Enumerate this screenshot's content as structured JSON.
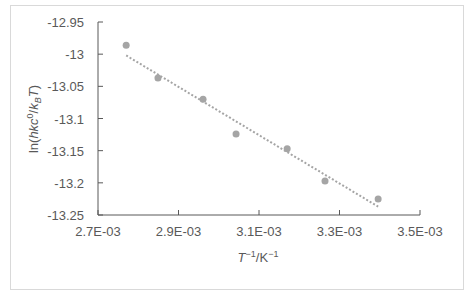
{
  "chart_data": {
    "type": "scatter",
    "title": "",
    "xlabel": "T^-1/K^-1",
    "ylabel": "ln(hkc^0/k_B T)",
    "xlim": [
      0.0027,
      0.0035
    ],
    "ylim": [
      -13.25,
      -12.95
    ],
    "x_ticks": [
      "2.7E-03",
      "2.9E-03",
      "3.1E-03",
      "3.3E-03",
      "3.5E-03"
    ],
    "y_ticks": [
      "-12.95",
      "-13",
      "-13.05",
      "-13.1",
      "-13.15",
      "-13.2",
      "-13.25"
    ],
    "grid": false,
    "legend": null,
    "series": [
      {
        "name": "data",
        "marker_color": "#a5a5a5",
        "x": [
          0.00277,
          0.002849,
          0.002961,
          0.003043,
          0.00317,
          0.003264,
          0.003396
        ],
        "y": [
          -12.986,
          -13.037,
          -13.07,
          -13.124,
          -13.147,
          -13.197,
          -13.225
        ]
      }
    ],
    "trendline": {
      "type": "linear",
      "style": "dotted",
      "color": "#a5a5a5",
      "x": [
        0.00277,
        0.003396
      ],
      "y": [
        -13.002,
        -13.237
      ]
    }
  },
  "axes": {
    "x_title_main": "T",
    "x_title_sup1": "−1",
    "x_title_unit": "/K",
    "x_title_sup2": "−1",
    "y_title_prefix": "ln(",
    "y_title_hkc": "hkc",
    "y_title_sup": "0",
    "y_title_slash": "/",
    "y_title_k": "k",
    "y_title_sub": "B",
    "y_title_T": "T",
    "y_title_suffix": ")"
  }
}
